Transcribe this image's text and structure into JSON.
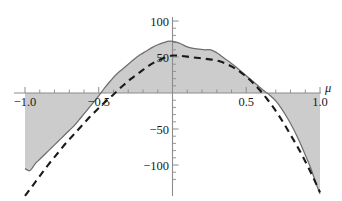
{
  "chart_data": {
    "type": "area",
    "title": "",
    "subtitle": "",
    "xlabel": "μ",
    "ylabel": "",
    "xlim": [
      -1.05,
      1.05
    ],
    "ylim": [
      -145,
      110
    ],
    "grid": false,
    "legend": "none",
    "x_ticks_major": [
      -1.0,
      -0.5,
      0.5,
      1.0
    ],
    "x_tick_labels": [
      "-1.0",
      "-0.5",
      "0.5",
      "1.0"
    ],
    "x_ticks_minor": [
      -0.9,
      -0.8,
      -0.7,
      -0.6,
      -0.4,
      -0.3,
      -0.2,
      -0.1,
      0.1,
      0.2,
      0.3,
      0.4,
      0.6,
      0.7,
      0.8,
      0.9
    ],
    "y_ticks_major": [
      100,
      50,
      -50,
      -100
    ],
    "y_tick_labels": [
      "100",
      "50",
      "-50",
      "-100"
    ],
    "y_ticks_minor": [
      90,
      80,
      70,
      60,
      40,
      30,
      20,
      10,
      -10,
      -20,
      -30,
      -40,
      -60,
      -70,
      -80,
      -90,
      -110,
      -120
    ],
    "series": [
      {
        "name": "solid-shaded",
        "style": "solid",
        "filled": true,
        "fill_color": "#c9c9c9",
        "line_color": "#6e6e6e",
        "x": [
          -1.0,
          -0.97,
          -0.95,
          -0.93,
          -0.9,
          -0.86,
          -0.82,
          -0.78,
          -0.74,
          -0.7,
          -0.66,
          -0.62,
          -0.58,
          -0.54,
          -0.5,
          -0.46,
          -0.42,
          -0.38,
          -0.34,
          -0.3,
          -0.26,
          -0.22,
          -0.18,
          -0.14,
          -0.1,
          -0.06,
          -0.02,
          0.02,
          0.06,
          0.1,
          0.14,
          0.18,
          0.22,
          0.26,
          0.3,
          0.34,
          0.38,
          0.42,
          0.46,
          0.5,
          0.54,
          0.58,
          0.62,
          0.66,
          0.7,
          0.74,
          0.78,
          0.82,
          0.86,
          0.9,
          0.94,
          0.97,
          1.0
        ],
        "y": [
          -105,
          -108,
          -104,
          -98,
          -92,
          -84,
          -76,
          -68,
          -60,
          -52,
          -44,
          -34,
          -24,
          -14,
          -4,
          7,
          17,
          26,
          33,
          40,
          47,
          53,
          58,
          63,
          67,
          70,
          72,
          71,
          68,
          64,
          62,
          61,
          60,
          60,
          56,
          50,
          44,
          38,
          31,
          24,
          17,
          10,
          3,
          -3,
          -11,
          -22,
          -35,
          -50,
          -67,
          -86,
          -106,
          -124,
          -140
        ]
      },
      {
        "name": "dashed",
        "style": "dashed",
        "filled": false,
        "line_color": "#1a1a1a",
        "x": [
          -1.0,
          -0.96,
          -0.92,
          -0.88,
          -0.84,
          -0.8,
          -0.76,
          -0.72,
          -0.68,
          -0.64,
          -0.6,
          -0.56,
          -0.52,
          -0.48,
          -0.44,
          -0.4,
          -0.36,
          -0.32,
          -0.28,
          -0.24,
          -0.2,
          -0.16,
          -0.12,
          -0.08,
          -0.04,
          0.0,
          0.04,
          0.08,
          0.12,
          0.16,
          0.2,
          0.24,
          0.28,
          0.32,
          0.36,
          0.4,
          0.44,
          0.48,
          0.52,
          0.56,
          0.6,
          0.64,
          0.68,
          0.72,
          0.76,
          0.8,
          0.84,
          0.88,
          0.92,
          0.96,
          1.0
        ],
        "y": [
          -143,
          -132,
          -121,
          -110,
          -99,
          -89,
          -79,
          -69,
          -60,
          -51,
          -42,
          -33,
          -25,
          -17,
          -9,
          -2,
          6,
          13,
          20,
          26,
          32,
          38,
          43,
          47,
          50,
          52,
          52,
          51,
          50,
          49,
          48,
          47,
          46,
          44,
          41,
          37,
          32,
          26,
          19,
          11,
          2,
          -8,
          -19,
          -31,
          -44,
          -58,
          -72,
          -87,
          -103,
          -120,
          -138
        ]
      }
    ]
  },
  "axes": {
    "x_axis_name": "mu-axis",
    "y_axis_name": "value-axis"
  }
}
